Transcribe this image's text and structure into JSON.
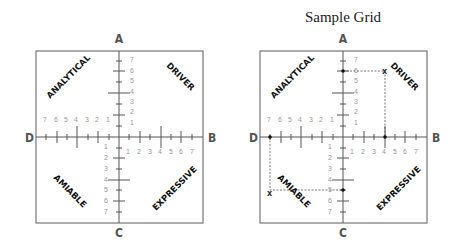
{
  "title": "Sample Grid",
  "grids": [
    {
      "name": "blank-grid",
      "axes": {
        "top": "A",
        "right": "B",
        "bottom": "C",
        "left": "D"
      },
      "quadrants": {
        "top_left": "ANALYTICAL",
        "top_right": "DRIVER",
        "bottom_left": "AMIABLE",
        "bottom_right": "EXPRESSIVE"
      },
      "scale": [
        "1",
        "2",
        "3",
        "4",
        "5",
        "6",
        "7"
      ]
    },
    {
      "name": "sample-grid",
      "axes": {
        "top": "A",
        "right": "B",
        "bottom": "C",
        "left": "D"
      },
      "quadrants": {
        "top_left": "ANALYTICAL",
        "top_right": "DRIVER",
        "bottom_left": "AMIABLE",
        "bottom_right": "EXPRESSIVE"
      },
      "scale": [
        "1",
        "2",
        "3",
        "4",
        "5",
        "6",
        "7"
      ],
      "plotted_points": [
        {
          "axis": "A",
          "value": 6
        },
        {
          "axis": "B",
          "value": 4
        },
        {
          "axis": "C",
          "value": 6
        },
        {
          "axis": "D",
          "value": 7
        }
      ],
      "marks": [
        {
          "label": "x",
          "quadrant": "DRIVER",
          "x": 4,
          "y": 6
        },
        {
          "label": "x",
          "quadrant": "AMIABLE",
          "x": -7,
          "y": -6
        }
      ]
    }
  ]
}
